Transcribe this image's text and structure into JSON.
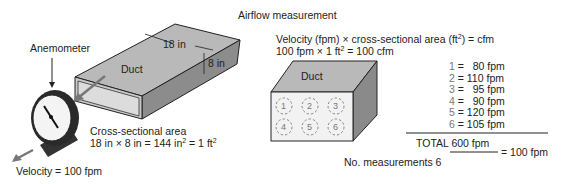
{
  "title": "Airflow measurement",
  "left": {
    "anemometer_label": "Anemometer",
    "duct_label": "Duct",
    "width_label": "18 in",
    "height_label": "8 in",
    "area_title": "Cross-sectional area",
    "area_formula_a": "18 in × 8 in = 144  in",
    "area_formula_b": " = 1 ft",
    "sup2": "2",
    "velocity": "Velocity = 100 fpm"
  },
  "right": {
    "formula_line1_a": "Velocity (fpm) × cross-sectional area (ft",
    "formula_line1_b": ") = cfm",
    "formula_line2_a": "100 fpm × 1 ft",
    "formula_line2_b": " = 100 cfm",
    "sup2": "2",
    "duct_label": "Duct",
    "grid_points": [
      "1",
      "2",
      "3",
      "4",
      "5",
      "6"
    ],
    "measurements": [
      {
        "n": "1",
        "value": "  80 fpm"
      },
      {
        "n": "2",
        "value": "110 fpm"
      },
      {
        "n": "3",
        "value": "  95 fpm"
      },
      {
        "n": "4",
        "value": "  90 fpm"
      },
      {
        "n": "5",
        "value": "120 fpm"
      },
      {
        "n": "6",
        "value": "105 fpm"
      }
    ],
    "total": "TOTAL 600 fpm",
    "average": "= 100 fpm",
    "count": "No. measurements 6"
  }
}
